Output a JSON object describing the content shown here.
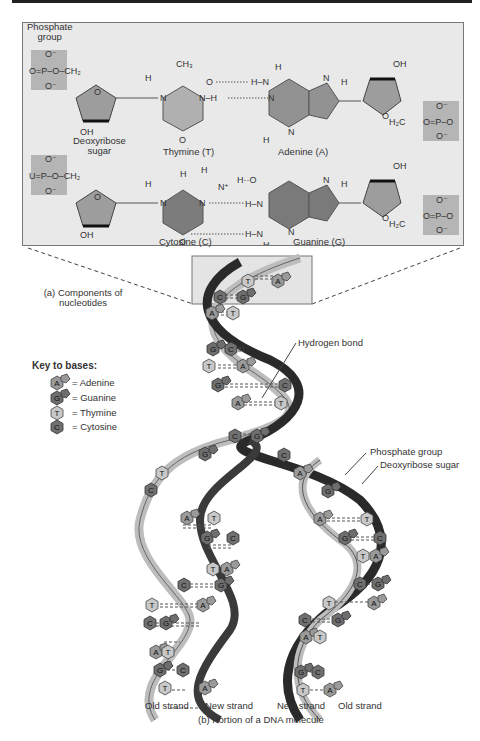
{
  "figure": {
    "panel_a": {
      "caption": "(a) Components of nucleotides",
      "caption_lines": [
        "(a) Components of",
        "nucleotides"
      ],
      "labels": {
        "phosphate_group": [
          "Phosphate",
          "group"
        ],
        "deoxyribose_sugar": [
          "Deoxyribose",
          "sugar"
        ],
        "thymine": "Thymine (T)",
        "adenine": "Adenine (A)",
        "cytosine": "Cytosine (C)",
        "guanine": "Guanine (G)"
      },
      "atoms": {
        "O": "O",
        "O_minus": "O⁻",
        "P": "P",
        "CH2": "CH₂",
        "H2C": "H₂C",
        "CH3": "CH₃",
        "OH": "OH",
        "H": "H",
        "N": "N",
        "N_plus": "N⁺",
        "U": "U"
      }
    },
    "key": {
      "title": "Key to bases:",
      "items": [
        {
          "letter": "A",
          "label": "= Adenine",
          "shape": "hexagon+pentagon",
          "color": "#9a9a9a"
        },
        {
          "letter": "G",
          "label": "= Guanine",
          "shape": "hexagon+pentagon",
          "color": "#6e6e6e"
        },
        {
          "letter": "T",
          "label": "= Thymine",
          "shape": "hexagon",
          "color": "#c8c8c8"
        },
        {
          "letter": "C",
          "label": "= Cytosine",
          "shape": "hexagon",
          "color": "#707070"
        }
      ]
    },
    "callouts": {
      "hydrogen_bond": "Hydrogen bond",
      "phosphate_group": "Phosphate group",
      "deoxyribose_sugar": "Deoxyribose sugar"
    },
    "panel_b": {
      "caption": "(b) Portion of a DNA molecule",
      "strand_labels": [
        "Old strand",
        "New strand",
        "New strand",
        "Old strand"
      ]
    },
    "base_pairs": {
      "top_helix": [
        [
          "T",
          "A"
        ],
        [
          "C",
          "G"
        ],
        [
          "A",
          "T"
        ],
        [
          "G",
          "C"
        ],
        [
          "T",
          "A"
        ],
        [
          "G",
          "C"
        ],
        [
          "A",
          "T"
        ],
        [
          "C",
          "G"
        ]
      ],
      "left_daughter": [
        [
          "G",
          ""
        ],
        [
          "T",
          ""
        ],
        [
          "C",
          ""
        ],
        [
          "A",
          "T"
        ],
        [
          "G",
          "C"
        ],
        [
          "T",
          "A"
        ],
        [
          "C",
          "G"
        ],
        [
          "T",
          "A"
        ],
        [
          "C",
          "G"
        ],
        [
          "A",
          "T"
        ],
        [
          "G",
          "C"
        ],
        [
          "T",
          "A"
        ]
      ],
      "right_daughter": [
        [
          "C",
          ""
        ],
        [
          "A",
          ""
        ],
        [
          "G",
          ""
        ],
        [
          "A",
          "T"
        ],
        [
          "G",
          "C"
        ],
        [
          "T",
          "A"
        ],
        [
          "C",
          "G"
        ],
        [
          "T",
          "A"
        ],
        [
          "C",
          "G"
        ],
        [
          "A",
          "T"
        ],
        [
          "G",
          "C"
        ],
        [
          "T",
          "A"
        ]
      ]
    },
    "colors": {
      "panel_bg": "#e9e9e9",
      "phosphate_box": "#b5b5b5",
      "sugar": "#9d9d9d",
      "pyrimidine": "#b0b0b0",
      "purine": "#8e8e8e",
      "strand_dark": "#2a2a2a",
      "strand_light": "#bdbdbd"
    }
  }
}
